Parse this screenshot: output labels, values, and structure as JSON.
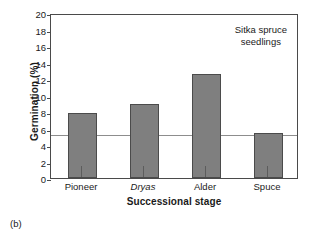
{
  "chart_data": {
    "type": "bar",
    "title": "",
    "annotation": "Sitka spruce\nseedlings",
    "annotation_line1": "Sitka spruce",
    "annotation_line2": "seedlings",
    "panel_label": "(b)",
    "xlabel": "Successional stage",
    "ylabel": "Germination (%)",
    "categories": [
      "Pioneer",
      "Dryas",
      "Alder",
      "Spuce"
    ],
    "categories_italic": [
      false,
      true,
      false,
      false
    ],
    "values": [
      7.85,
      9.0,
      12.6,
      5.5
    ],
    "ylim": [
      0,
      20
    ],
    "ytick_labels": [
      "0",
      "2",
      "4",
      "6",
      "8",
      "10",
      "12",
      "14",
      "16",
      "18",
      "20"
    ],
    "ytick_values": [
      0,
      2,
      4,
      6,
      8,
      10,
      12,
      14,
      16,
      18,
      20
    ],
    "reference_line": {
      "value": 5.4,
      "label": "",
      "color": "#8d8d8d"
    },
    "grid": false,
    "legend": "none",
    "colors": {
      "bar_fill": "#7f7f7f",
      "bar_edge": "#4b4b4b",
      "axis": "#4a4a4a",
      "text": "#1a1a1a",
      "background": "#ffffff"
    }
  }
}
